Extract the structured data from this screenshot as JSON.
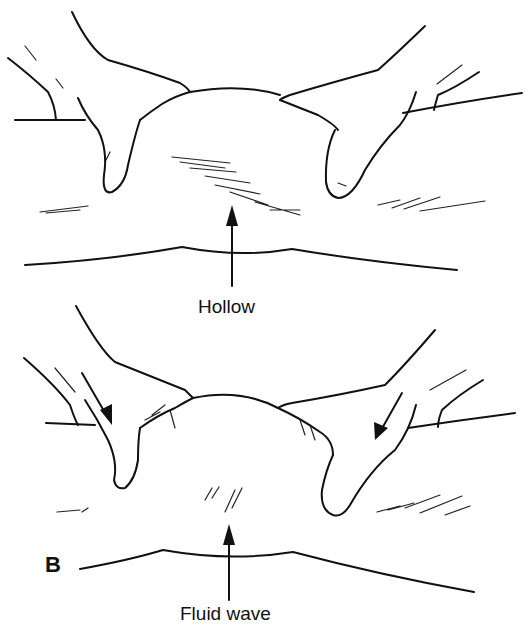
{
  "figure": {
    "panels": [
      {
        "id": "top",
        "letter": "",
        "arrow_label": "Hollow",
        "description": "Two hands resting on a distended abdomen; hatched shading at center"
      },
      {
        "id": "bottom",
        "letter": "B",
        "arrow_label": "Fluid wave",
        "description": "Two hands pressing inward on the abdomen (arrows indicate direction)"
      }
    ],
    "colors": {
      "ink": "#111111",
      "background": "#ffffff"
    }
  }
}
